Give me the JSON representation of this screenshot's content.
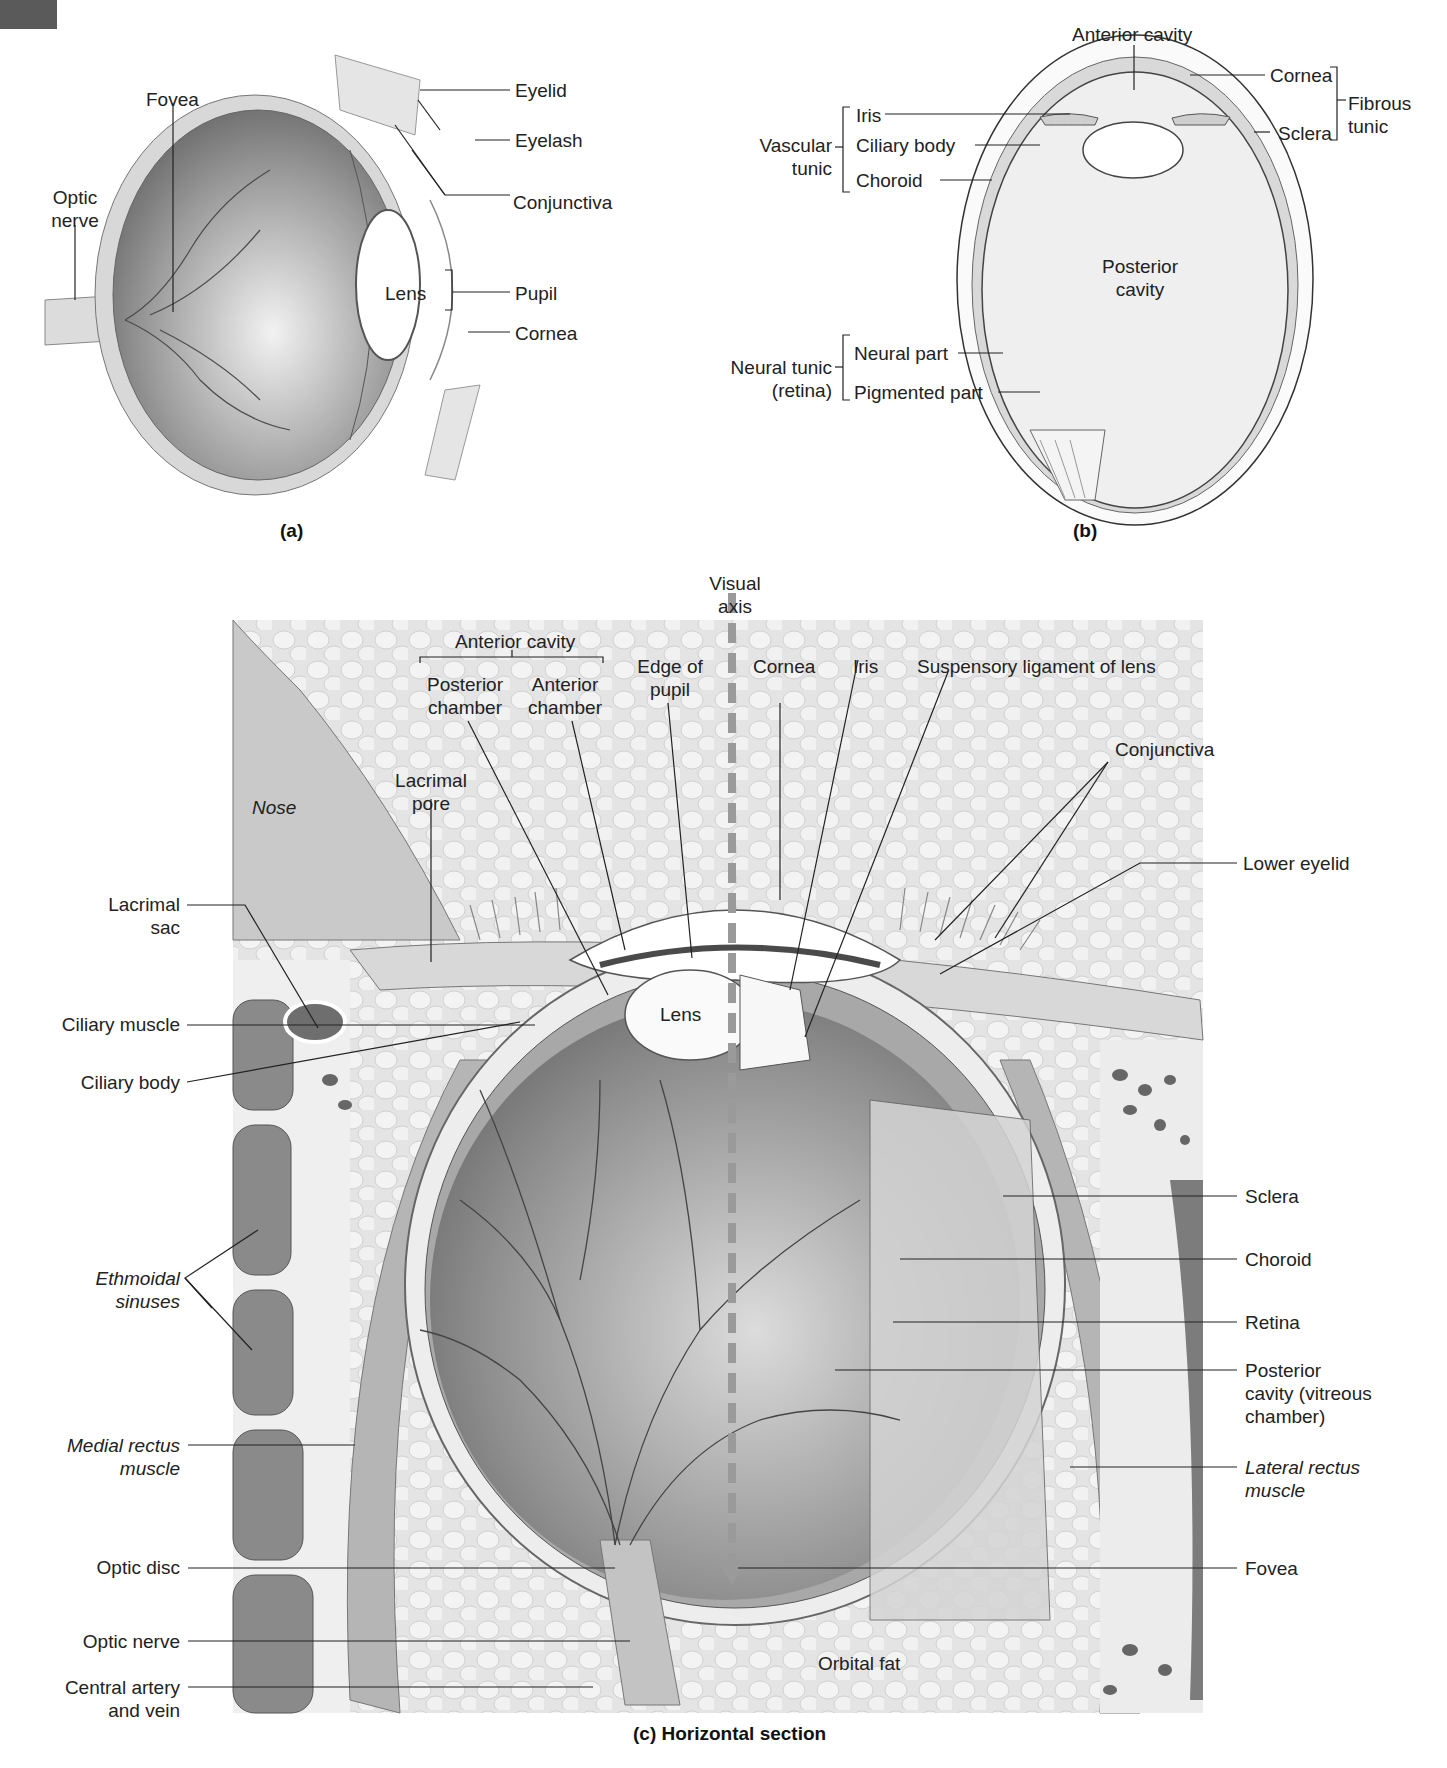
{
  "figure": {
    "panel_a": {
      "caption": "(a)",
      "labels": {
        "fovea": "Fovea",
        "optic_nerve": "Optic\nnerve",
        "eyelid": "Eyelid",
        "eyelash": "Eyelash",
        "conjunctiva": "Conjunctiva",
        "lens": "Lens",
        "pupil": "Pupil",
        "cornea": "Cornea"
      }
    },
    "panel_b": {
      "caption": "(b)",
      "labels": {
        "anterior_cavity": "Anterior cavity",
        "cornea": "Cornea",
        "sclera": "Sclera",
        "fibrous_tunic": "Fibrous\ntunic",
        "iris": "Iris",
        "ciliary_body": "Ciliary body",
        "choroid": "Choroid",
        "vascular_tunic": "Vascular\ntunic",
        "posterior_cavity": "Posterior\ncavity",
        "neural_part": "Neural part",
        "pigmented_part": "Pigmented part",
        "neural_tunic": "Neural tunic\n(retina)"
      }
    },
    "panel_c": {
      "caption": "(c) Horizontal section",
      "labels": {
        "visual_axis": "Visual\naxis",
        "anterior_cavity": "Anterior cavity",
        "posterior_chamber": "Posterior\nchamber",
        "anterior_chamber": "Anterior\nchamber",
        "edge_of_pupil": "Edge of\npupil",
        "cornea": "Cornea",
        "iris": "Iris",
        "suspensory_ligament": "Suspensory ligament of lens",
        "conjunctiva": "Conjunctiva",
        "lower_eyelid": "Lower eyelid",
        "nose": "Nose",
        "lacrimal_pore": "Lacrimal\npore",
        "lacrimal_sac": "Lacrimal\nsac",
        "ciliary_muscle": "Ciliary muscle",
        "ciliary_body": "Ciliary body",
        "lens": "Lens",
        "ethmoidal_sinuses": "Ethmoidal\nsinuses",
        "medial_rectus": "Medial rectus\nmuscle",
        "optic_disc": "Optic disc",
        "optic_nerve": "Optic nerve",
        "central_artery": "Central artery\nand vein",
        "sclera": "Sclera",
        "choroid": "Choroid",
        "retina": "Retina",
        "posterior_cavity": "Posterior\ncavity (vitreous\nchamber)",
        "lateral_rectus": "Lateral rectus\nmuscle",
        "fovea": "Fovea",
        "orbital_fat": "Orbital fat"
      }
    }
  },
  "colors": {
    "tissue_light": "#e6e6e6",
    "tissue_mid": "#bdbdbd",
    "tissue_dark": "#7a7a7a",
    "leader": "#222222",
    "visual_axis": "#9a9a9a"
  }
}
